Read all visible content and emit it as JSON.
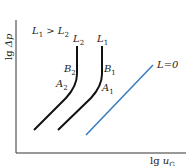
{
  "axes": {
    "y_label_prefix": "lg ",
    "y_label_var": "Δp",
    "x_label_prefix": "lg ",
    "x_label_var": "u",
    "x_label_sub": "G"
  },
  "condition": {
    "text_a": "L",
    "sub_a": "1",
    "op": " > ",
    "text_b": "L",
    "sub_b": "2"
  },
  "curves": {
    "L2": {
      "name": "L",
      "sub": "2",
      "B": "B",
      "B_sub": "2",
      "A": "A",
      "A_sub": "2"
    },
    "L1": {
      "name": "L",
      "sub": "1",
      "B": "B",
      "B_sub": "1",
      "A": "A",
      "A_sub": "1"
    },
    "L0": {
      "label": "L=0"
    }
  },
  "colors": {
    "curve": "#111111",
    "zero_line": "#3a7fc0",
    "axis": "#333333"
  }
}
